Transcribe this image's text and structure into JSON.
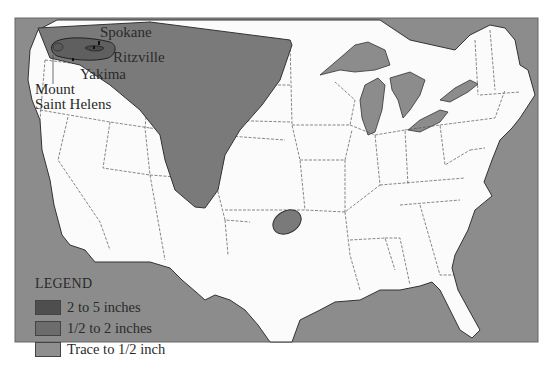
{
  "map": {
    "colors": {
      "water": "#8c8c8c",
      "land": "#fbfbfb",
      "heavy": "#5a5a5a",
      "medium": "#7a7a7a",
      "trace": "#8f8f8f",
      "border": "#555555"
    }
  },
  "labels": {
    "spokane": "Spokane",
    "ritzville": "Ritzville",
    "yakima": "Yakima",
    "mount_line1": "Mount",
    "mount_line2": "Saint Helens"
  },
  "legend": {
    "title": "LEGEND",
    "items": [
      {
        "label": "2 to 5 inches",
        "color": "#4e4e4e"
      },
      {
        "label": "1/2 to 2 inches",
        "color": "#6c6c6c"
      },
      {
        "label": "Trace to 1/2 inch",
        "color": "#8f8f8f"
      }
    ]
  }
}
